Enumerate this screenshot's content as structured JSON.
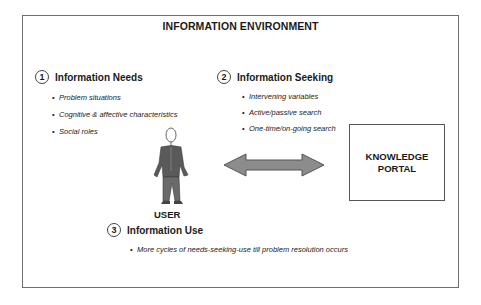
{
  "diagram": {
    "title": "INFORMATION ENVIRONMENT",
    "sections": [
      {
        "number": "1",
        "label": "Information Needs",
        "bullets": [
          "Problem situations",
          "Cognitive & affective characteristics",
          "Social roles"
        ]
      },
      {
        "number": "2",
        "label": "Information Seeking",
        "bullets": [
          "Intervening variables",
          "Active/passive search",
          "One-time/on-going search"
        ]
      },
      {
        "number": "3",
        "label": "Information Use",
        "bullets": [
          "More cycles of needs-seeking-use till problem resolution occurs"
        ]
      }
    ],
    "user_label": "USER",
    "portal": {
      "line1": "KNOWLEDGE",
      "line2": "PORTAL"
    },
    "colors": {
      "border": "#6e6e6e",
      "arrow_fill": "#8c8c8c",
      "arrow_stroke": "#555555",
      "figure": "#5a5a5a"
    }
  }
}
